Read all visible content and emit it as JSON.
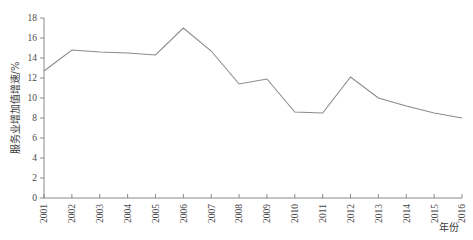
{
  "chart_data": {
    "type": "line",
    "title": "",
    "subtitle": "",
    "xlabel": "年份",
    "ylabel": "服务业增加值增速/%",
    "categories": [
      "2001",
      "2002",
      "2003",
      "2004",
      "2005",
      "2006",
      "2007",
      "2008",
      "2009",
      "2010",
      "2011",
      "2012",
      "2013",
      "2014",
      "2015",
      "2016"
    ],
    "series": [
      {
        "name": "服务业增加值增速",
        "values": [
          12.7,
          14.8,
          14.6,
          14.5,
          14.3,
          17.0,
          14.7,
          11.4,
          11.9,
          8.6,
          8.5,
          12.1,
          10.0,
          9.2,
          8.5,
          8.0
        ]
      }
    ],
    "xlim": [
      2001,
      2016
    ],
    "ylim": [
      0,
      18
    ],
    "yticks": [
      0,
      2,
      4,
      6,
      8,
      10,
      12,
      14,
      16,
      18
    ],
    "ytick_labels": [
      "0",
      "2",
      "4",
      "6",
      "8",
      "10",
      "12",
      "14",
      "16",
      "18"
    ],
    "grid": false,
    "legend": "none",
    "line_color": "#8a8a8a",
    "axis_color": "#7d7d7d",
    "text_color": "#4a4a4a"
  },
  "axes": {
    "y_title": "服务业增加值增速/%",
    "x_title": "年份"
  }
}
